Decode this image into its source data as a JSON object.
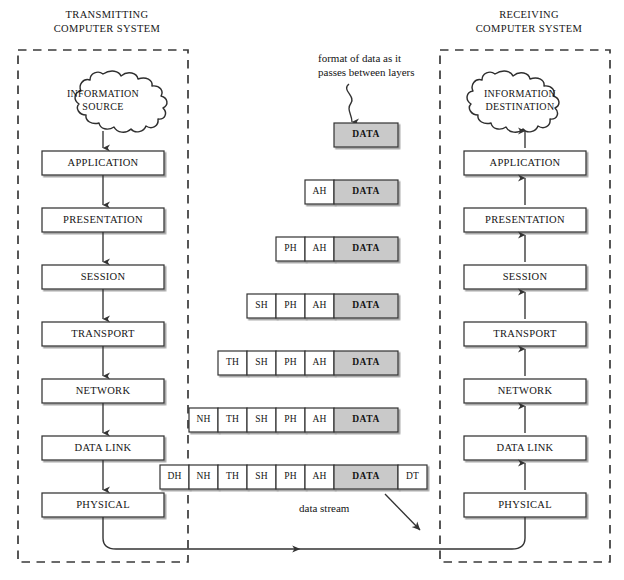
{
  "diagram": {
    "colors": {
      "data_fill": "#c9c9c9",
      "header_fill": "#ffffff",
      "stroke": "#3b3b3b",
      "dashed_border": "#3a3a3a",
      "text": "#141414",
      "background": "#ffffff"
    }
  },
  "transmitting": {
    "header": "TRANSMITTING\nCOMPUTER SYSTEM",
    "cloud": "INFORMATION\nSOURCE",
    "flow_direction": "down",
    "layers": [
      {
        "label": "APPLICATION"
      },
      {
        "label": "PRESENTATION"
      },
      {
        "label": "SESSION"
      },
      {
        "label": "TRANSPORT"
      },
      {
        "label": "NETWORK"
      },
      {
        "label": "DATA LINK"
      },
      {
        "label": "PHYSICAL"
      }
    ]
  },
  "receiving": {
    "header": "RECEIVING\nCOMPUTER SYSTEM",
    "cloud": "INFORMATION\nDESTINATION",
    "flow_direction": "up",
    "layers": [
      {
        "label": "APPLICATION"
      },
      {
        "label": "PRESENTATION"
      },
      {
        "label": "SESSION"
      },
      {
        "label": "TRANSPORT"
      },
      {
        "label": "NETWORK"
      },
      {
        "label": "DATA LINK"
      },
      {
        "label": "PHYSICAL"
      }
    ]
  },
  "annotations": {
    "format_note": "format of data as it\npasses between layers",
    "data_stream": "data stream"
  },
  "packets": [
    {
      "layer": "APPLICATION",
      "cells": [
        {
          "label": "DATA",
          "type": "data"
        }
      ]
    },
    {
      "layer": "PRESENTATION",
      "cells": [
        {
          "label": "AH",
          "type": "header"
        },
        {
          "label": "DATA",
          "type": "data"
        }
      ]
    },
    {
      "layer": "SESSION",
      "cells": [
        {
          "label": "PH",
          "type": "header"
        },
        {
          "label": "AH",
          "type": "header"
        },
        {
          "label": "DATA",
          "type": "data"
        }
      ]
    },
    {
      "layer": "TRANSPORT",
      "cells": [
        {
          "label": "SH",
          "type": "header"
        },
        {
          "label": "PH",
          "type": "header"
        },
        {
          "label": "AH",
          "type": "header"
        },
        {
          "label": "DATA",
          "type": "data"
        }
      ]
    },
    {
      "layer": "NETWORK",
      "cells": [
        {
          "label": "TH",
          "type": "header"
        },
        {
          "label": "SH",
          "type": "header"
        },
        {
          "label": "PH",
          "type": "header"
        },
        {
          "label": "AH",
          "type": "header"
        },
        {
          "label": "DATA",
          "type": "data"
        }
      ]
    },
    {
      "layer": "DATA LINK",
      "cells": [
        {
          "label": "NH",
          "type": "header"
        },
        {
          "label": "TH",
          "type": "header"
        },
        {
          "label": "SH",
          "type": "header"
        },
        {
          "label": "PH",
          "type": "header"
        },
        {
          "label": "AH",
          "type": "header"
        },
        {
          "label": "DATA",
          "type": "data"
        }
      ]
    },
    {
      "layer": "PHYSICAL",
      "cells": [
        {
          "label": "DH",
          "type": "header"
        },
        {
          "label": "NH",
          "type": "header"
        },
        {
          "label": "TH",
          "type": "header"
        },
        {
          "label": "SH",
          "type": "header"
        },
        {
          "label": "PH",
          "type": "header"
        },
        {
          "label": "AH",
          "type": "header"
        },
        {
          "label": "DATA",
          "type": "data"
        },
        {
          "label": "DT",
          "type": "header"
        }
      ]
    }
  ],
  "legend": {
    "AH": "Application Header",
    "PH": "Presentation Header",
    "SH": "Session Header",
    "TH": "Transport Header",
    "NH": "Network Header",
    "DH": "Data Link Header",
    "DT": "Data Link Trailer"
  }
}
